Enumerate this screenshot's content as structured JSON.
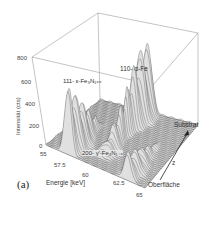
{
  "chart_data": {
    "type": "waterfall-3d",
    "panel_label": "(a)",
    "xlabel": "Energie [keV]",
    "ylabel": "Intensität (cts)",
    "zlabel": "z",
    "z_axis_ends": {
      "start": "Oberfläche",
      "end": "Substrat"
    },
    "x_ticks": [
      "55",
      "57.5",
      "60",
      "62.5",
      "65"
    ],
    "y_ticks": [
      "0",
      "200",
      "400",
      "600",
      "800"
    ],
    "xlim": [
      55,
      65
    ],
    "ylim": [
      0,
      800
    ],
    "grid": false,
    "peaks": [
      {
        "label": "111- ε-Fe3N1+x",
        "energy_kev": 57.2,
        "max_intensity": 620,
        "present_near": "Oberfläche"
      },
      {
        "label": "110- α-Fe",
        "energy_kev": 60.0,
        "max_intensity": 640,
        "present_near": "Substrat"
      },
      {
        "label": "200- γ'-Fe4N1-x",
        "energy_kev": 63.2,
        "max_intensity": 250,
        "present_near": "Oberfläche"
      }
    ]
  },
  "labels": {
    "panel": "(a)",
    "xlabel": "Energie [keV]",
    "ylabel": "Intensität (cts)",
    "z": "z",
    "substrat": "Substrat",
    "oberflaeche": "Oberfläche",
    "peak1": "111- ε-Fe₃N₁₊ₓ",
    "peak2": "110- α-Fe",
    "peak3": "200- γ'-Fe₄N₁₋ₓ",
    "x_ticks": [
      "55",
      "57.5",
      "60",
      "62.5",
      "65"
    ],
    "y_ticks": [
      "0",
      "200",
      "400",
      "600",
      "800"
    ]
  }
}
